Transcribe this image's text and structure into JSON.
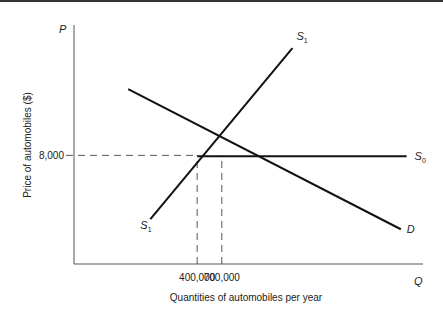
{
  "chart_data": {
    "type": "line",
    "title": "",
    "xlabel": "Quantities of automobiles per year",
    "ylabel": "Price of automobiles ($)",
    "x_axis_symbol": "Q",
    "y_axis_symbol": "P",
    "x_ticks": [
      {
        "value": 400000,
        "label": "400,000"
      },
      {
        "value": 700000,
        "label": "700,000"
      }
    ],
    "y_ticks": [
      {
        "value": 8000,
        "label": "8,000"
      }
    ],
    "xlim": [
      -1100000,
      3150000
    ],
    "ylim": [
      0,
      17600
    ],
    "grid": false,
    "series": [
      {
        "name": "S1",
        "label_main": "S",
        "label_sub": "1",
        "points": [
          [
            -170000,
            3300
          ],
          [
            1560000,
            15900
          ]
        ]
      },
      {
        "name": "S0",
        "label_main": "S",
        "label_sub": "0",
        "points": [
          [
            400000,
            7930
          ],
          [
            2950000,
            7930
          ]
        ]
      },
      {
        "name": "D",
        "label_main": "D",
        "label_sub": "",
        "points": [
          [
            -440000,
            12880
          ],
          [
            2880000,
            2560
          ]
        ]
      }
    ],
    "reference_lines": [
      {
        "type": "horizontal",
        "value": 8000,
        "from_x": -1100000,
        "to_x": 400000,
        "style": "dashed"
      },
      {
        "type": "vertical",
        "value": 400000,
        "from_y": 0,
        "to_y": 8000,
        "style": "dashed"
      },
      {
        "type": "vertical",
        "value": 700000,
        "from_y": 0,
        "to_y": 8000,
        "style": "dashed"
      }
    ]
  }
}
